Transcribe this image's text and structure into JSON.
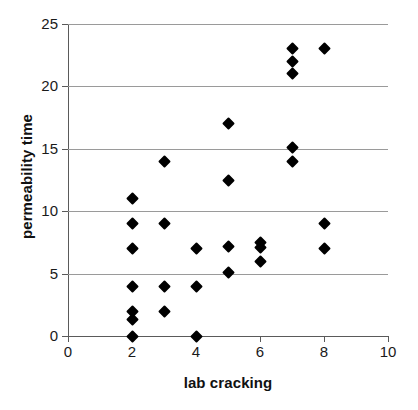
{
  "chart_data": {
    "type": "scatter",
    "title": "",
    "xlabel": "lab cracking",
    "ylabel": "permeability time",
    "xlim": [
      0,
      10
    ],
    "ylim": [
      0,
      25
    ],
    "xticks": [
      0,
      2,
      4,
      6,
      8,
      10
    ],
    "yticks": [
      0,
      5,
      10,
      15,
      20,
      25
    ],
    "xtick_labels": [
      "0",
      "2",
      "4",
      "6",
      "8",
      "10"
    ],
    "ytick_labels": [
      "0",
      "5",
      "10",
      "15",
      "20",
      "25"
    ],
    "grid": "horizontal",
    "legend": "none",
    "marker": "diamond",
    "marker_color": "#000000",
    "points": [
      {
        "x": 2,
        "y": 11
      },
      {
        "x": 2,
        "y": 9
      },
      {
        "x": 2,
        "y": 7
      },
      {
        "x": 2,
        "y": 4
      },
      {
        "x": 2,
        "y": 2
      },
      {
        "x": 2,
        "y": 1.3
      },
      {
        "x": 2,
        "y": 0
      },
      {
        "x": 3,
        "y": 14
      },
      {
        "x": 3,
        "y": 9
      },
      {
        "x": 3,
        "y": 4
      },
      {
        "x": 3,
        "y": 2
      },
      {
        "x": 4,
        "y": 7
      },
      {
        "x": 4,
        "y": 4
      },
      {
        "x": 4,
        "y": 0
      },
      {
        "x": 5,
        "y": 17
      },
      {
        "x": 5,
        "y": 12.5
      },
      {
        "x": 5,
        "y": 7.2
      },
      {
        "x": 5,
        "y": 5.1
      },
      {
        "x": 6,
        "y": 7.5
      },
      {
        "x": 6,
        "y": 7.1
      },
      {
        "x": 6,
        "y": 6
      },
      {
        "x": 7,
        "y": 23
      },
      {
        "x": 7,
        "y": 22
      },
      {
        "x": 7,
        "y": 21
      },
      {
        "x": 7,
        "y": 15.1
      },
      {
        "x": 7,
        "y": 14
      },
      {
        "x": 8,
        "y": 23
      },
      {
        "x": 8,
        "y": 9
      },
      {
        "x": 8,
        "y": 7
      }
    ]
  }
}
